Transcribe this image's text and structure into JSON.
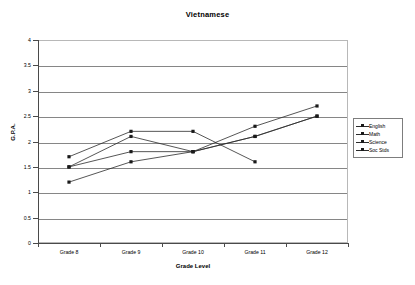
{
  "chart_data": {
    "type": "line",
    "title": "Vietnamese",
    "xlabel": "Grade Level",
    "ylabel": "G.P.A.",
    "categories": [
      "Grade 8",
      "Grade 9",
      "Grade 10",
      "Grade 11",
      "Grade 12"
    ],
    "ylim": [
      0,
      4
    ],
    "ytick_labels": [
      "0",
      "0.5",
      "1",
      "1.5",
      "2",
      "2.5",
      "3",
      "3.5",
      "4"
    ],
    "ytick_values": [
      0,
      0.5,
      1,
      1.5,
      2,
      2.5,
      3,
      3.5,
      4
    ],
    "grid": "horizontal",
    "legend_position": "right",
    "series": [
      {
        "name": "English",
        "values": [
          1.5,
          2.1,
          1.8,
          2.3,
          2.7
        ]
      },
      {
        "name": "Math",
        "values": [
          1.2,
          1.6,
          1.8,
          2.1,
          2.5
        ]
      },
      {
        "name": "Science",
        "values": [
          1.7,
          2.2,
          2.2,
          1.6,
          null
        ]
      },
      {
        "name": "Soc Stds",
        "values": [
          1.5,
          1.8,
          1.8,
          2.1,
          2.5
        ]
      }
    ],
    "colors": {
      "series_line": "#2b2b2b",
      "gridline": "#868686",
      "axis": "#4a4a4a",
      "plot_border": "#b8b8b8",
      "background": "#ffffff"
    }
  }
}
